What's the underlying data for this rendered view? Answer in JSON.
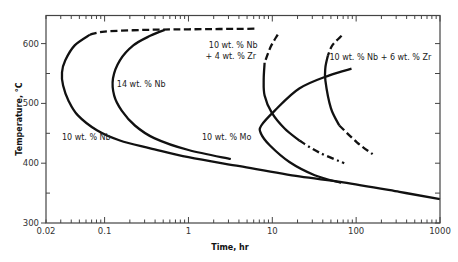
{
  "chart_data": {
    "type": "line",
    "title": "",
    "xlabel": "Time, hr",
    "ylabel": "Temperature, °C",
    "xscale": "log",
    "xlim": [
      0.02,
      1000
    ],
    "ylim": [
      300,
      647
    ],
    "grid": false,
    "legend": "none (curves labeled directly)",
    "x_ticks": [
      {
        "value": 0.02,
        "label": "0.02"
      },
      {
        "value": 0.1,
        "label": "0.1"
      },
      {
        "value": 1,
        "label": "1"
      },
      {
        "value": 10,
        "label": "10"
      },
      {
        "value": 100,
        "label": "100"
      },
      {
        "value": 1000,
        "label": "1000"
      }
    ],
    "y_ticks": [
      {
        "value": 300,
        "label": "300"
      },
      {
        "value": 400,
        "label": "400"
      },
      {
        "value": 500,
        "label": "500"
      },
      {
        "value": 600,
        "label": "600"
      }
    ],
    "y_minor_ticks": [
      350,
      450,
      550,
      650
    ],
    "series": [
      {
        "name": "10 wt. % Nb",
        "segments": [
          {
            "style": "dashed",
            "points": [
              [
                0.067,
                615
              ],
              [
                0.1,
                620
              ],
              [
                0.3,
                623
              ],
              [
                1,
                624
              ],
              [
                6.6,
                625
              ]
            ]
          },
          {
            "style": "solid",
            "points": [
              [
                0.067,
                615
              ],
              [
                0.044,
                597
              ],
              [
                0.034,
                572
              ],
              [
                0.031,
                552
              ],
              [
                0.032,
                530
              ],
              [
                0.037,
                505
              ],
              [
                0.048,
                480
              ],
              [
                0.081,
                455
              ],
              [
                0.152,
                438
              ],
              [
                0.35,
                425
              ],
              [
                1.0,
                410
              ],
              [
                4.1,
                395
              ],
              [
                21,
                378
              ],
              [
                70,
                368
              ],
              [
                328,
                352
              ],
              [
                1000,
                340
              ]
            ]
          }
        ]
      },
      {
        "name": "14 wt. % Nb",
        "segments": [
          {
            "style": "solid",
            "points": [
              [
                0.52,
                623
              ],
              [
                0.35,
                613
              ],
              [
                0.22,
                597
              ],
              [
                0.152,
                572
              ],
              [
                0.126,
                542
              ],
              [
                0.13,
                513
              ],
              [
                0.16,
                488
              ],
              [
                0.23,
                463
              ],
              [
                0.39,
                442
              ],
              [
                1.0,
                422
              ],
              [
                3.2,
                407
              ]
            ]
          }
        ]
      },
      {
        "name": "10 wt. % Nb + 4 wt. % Zr",
        "segments": [
          {
            "style": "dashed",
            "points": [
              [
                11.6,
                615
              ],
              [
                9.6,
                595
              ],
              [
                8.1,
                568
              ]
            ]
          },
          {
            "style": "solid",
            "points": [
              [
                8.1,
                568
              ],
              [
                7.9,
                540
              ],
              [
                8.1,
                513
              ],
              [
                9.8,
                485
              ],
              [
                14,
                458
              ],
              [
                21,
                438
              ]
            ]
          },
          {
            "style": "dashdot",
            "points": [
              [
                21,
                438
              ],
              [
                36,
                418
              ],
              [
                72,
                400
              ]
            ]
          }
        ]
      },
      {
        "name": "10 wt. % Mo",
        "segments": [
          {
            "style": "solid",
            "points": [
              [
                88,
                558
              ],
              [
                48,
                547
              ],
              [
                21,
                525
              ],
              [
                10.7,
                488
              ],
              [
                7.4,
                463
              ],
              [
                7.3,
                450
              ],
              [
                9.3,
                430
              ],
              [
                16,
                402
              ],
              [
                32,
                380
              ],
              [
                66,
                367
              ]
            ]
          }
        ]
      },
      {
        "name": "10 wt. % Nb + 6 wt. % Zr",
        "segments": [
          {
            "style": "dashed",
            "points": [
              [
                67,
                613
              ],
              [
                52,
                597
              ],
              [
                46,
                580
              ]
            ]
          },
          {
            "style": "solid",
            "points": [
              [
                46,
                580
              ],
              [
                43,
                560
              ],
              [
                43,
                538
              ],
              [
                50,
                492
              ],
              [
                63,
                463
              ]
            ]
          },
          {
            "style": "dashed",
            "points": [
              [
                63,
                463
              ],
              [
                102,
                435
              ],
              [
                157,
                415
              ]
            ]
          }
        ]
      }
    ],
    "annotations": [
      {
        "text": "10 wt. % Nb",
        "x": 0.031,
        "y": 443
      },
      {
        "text": "14 wt. % Nb",
        "x": 0.14,
        "y": 532
      },
      {
        "text": "10 wt. % Nb",
        "x": 1.75,
        "y": 597
      },
      {
        "text": "+ 4 wt. % Zr",
        "x": 1.6,
        "y": 579
      },
      {
        "text": "10 wt. % Mo",
        "x": 1.45,
        "y": 443
      },
      {
        "text": "10 wt. % Nb + 6 wt. % Zr",
        "x": 48,
        "y": 577
      }
    ]
  }
}
